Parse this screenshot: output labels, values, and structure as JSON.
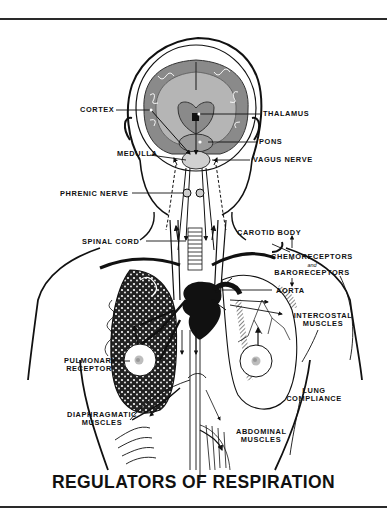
{
  "title": "REGULATORS OF RESPIRATION",
  "labels": {
    "cortex": "CORTEX",
    "thalamus": "THALAMUS",
    "pons": "PONS",
    "medulla": "MEDULLA",
    "vagus_nerve": "VAGUS  NERVE",
    "phrenic_nerve": "PHRENIC  NERVE",
    "spinal_cord": "SPINAL  CORD",
    "carotid_body": "CAROTID  BODY",
    "chemoreceptors": "CHEMORECEPTORS",
    "and": "and",
    "baroreceptors": "BARORECEPTORS",
    "aorta": "AORTA",
    "intercostal_1": "INTERCOSTAL",
    "intercostal_2": "MUSCLES",
    "pulmonary_1": "PULMONARY",
    "pulmonary_2": "RECEPTOR",
    "lung_compliance_1": "LUNG",
    "lung_compliance_2": "COMPLIANCE",
    "diaphragmatic_1": "DIAPHRAGMATIC",
    "diaphragmatic_2": "MUSCLES",
    "abdominal_1": "ABDOMINAL",
    "abdominal_2": "MUSCLES"
  },
  "colors": {
    "ink": "#111111",
    "brain_gray": "#8a8a8a",
    "white_matter": "#b5b5b5",
    "background": "#ffffff"
  }
}
